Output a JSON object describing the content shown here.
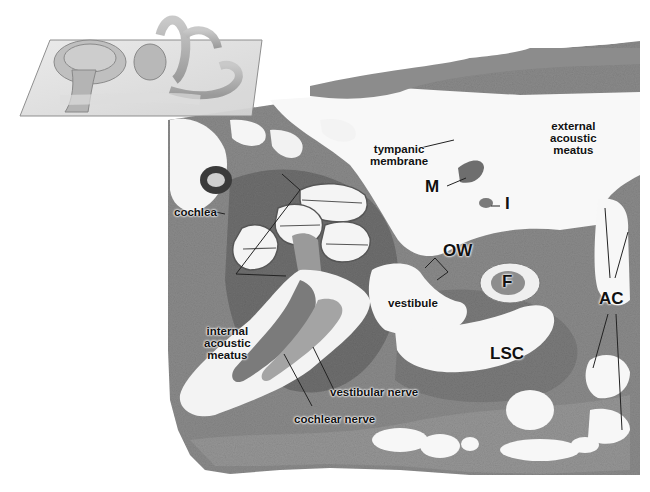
{
  "figure": {
    "inset": {
      "description": "3D schematic of inner ear labyrinth (cochlea, vestibule, semicircular canals) on a transparent section plane"
    },
    "labels": {
      "tympanic_membrane": [
        "tympanic",
        "membrane"
      ],
      "external_acoustic_meatus": [
        "external",
        "acoustic",
        "meatus"
      ],
      "malleus": "M",
      "incus": "I",
      "cochlea": "cochlea",
      "oval_window": "OW",
      "facial_nerve": "F",
      "vestibule": "vestibule",
      "air_cells": "AC",
      "internal_acoustic_meatus": [
        "internal",
        "acoustic",
        "meatus"
      ],
      "lateral_semicircular_canal": "LSC",
      "vestibular_nerve": "vestibular nerve",
      "cochlear_nerve": "cochlear nerve"
    },
    "colors": {
      "tissue_dark": "#6b6b6b",
      "tissue_mid": "#8a8a8a",
      "tissue_light": "#a9a9a9",
      "lumen": "#f7f7f7",
      "background": "#ffffff",
      "label": "#111111",
      "leader_line": "#222222"
    }
  }
}
